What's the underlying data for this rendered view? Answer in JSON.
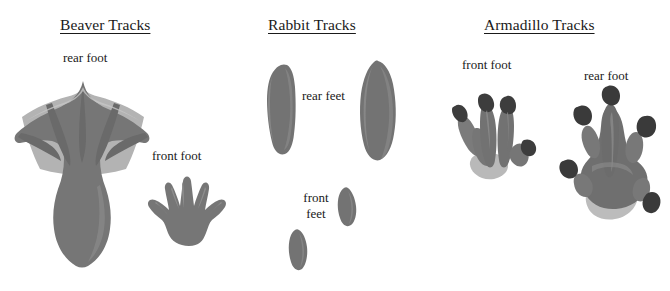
{
  "figure": {
    "title_note": "Animal track identification chart",
    "background_color": "#ffffff",
    "width": 670,
    "height": 291
  },
  "palette": {
    "toe_gray": "#7e7e7e",
    "pad_gray": "#6f6f6f",
    "web_light_gray": "#b3b3b3",
    "heel_light_gray": "#b9b9b9",
    "claw_dark": "#3b3b3b",
    "outline_gray": "#8c8c8c",
    "text_color": "#1a1a1a"
  },
  "panels": [
    {
      "id": "beaver",
      "title": "Beaver Tracks",
      "labels": [
        {
          "id": "beaver-rear",
          "text": "rear foot",
          "lines": [
            "rear foot"
          ]
        },
        {
          "id": "beaver-front",
          "text": "front foot",
          "lines": [
            "front foot"
          ]
        }
      ],
      "tracks": [
        {
          "id": "beaver-rear-foot",
          "name": "beaver-rear-foot-track",
          "description": "large webbed hind foot with five toes and light webbing",
          "toe_count": 5,
          "webbed": true
        },
        {
          "id": "beaver-front-foot",
          "name": "beaver-front-foot-track",
          "description": "small hand-like front foot with five splayed toes",
          "toe_count": 5,
          "webbed": false
        }
      ]
    },
    {
      "id": "rabbit",
      "title": "Rabbit Tracks",
      "labels": [
        {
          "id": "rabbit-rear",
          "text": "rear feet",
          "lines": [
            "rear feet"
          ]
        },
        {
          "id": "rabbit-front",
          "text": "front feet",
          "lines": [
            "front",
            "feet"
          ]
        }
      ],
      "tracks": [
        {
          "id": "rabbit-rear-left",
          "name": "rabbit-rear-left-track",
          "description": "elongated narrow hind foot print, left",
          "toe_count": 0,
          "webbed": false
        },
        {
          "id": "rabbit-rear-right",
          "name": "rabbit-rear-right-track",
          "description": "elongated wide hind foot print, right",
          "toe_count": 0,
          "webbed": false
        },
        {
          "id": "rabbit-front-upper",
          "name": "rabbit-front-upper-track",
          "description": "small oval front foot print, upper right",
          "toe_count": 0,
          "webbed": false
        },
        {
          "id": "rabbit-front-lower",
          "name": "rabbit-front-lower-track",
          "description": "small oval front foot print, lower left",
          "toe_count": 0,
          "webbed": false
        }
      ]
    },
    {
      "id": "armadillo",
      "title": "Armadillo Tracks",
      "labels": [
        {
          "id": "armadillo-front",
          "text": "front foot",
          "lines": [
            "front foot"
          ]
        },
        {
          "id": "armadillo-rear",
          "text": "rear foot",
          "lines": [
            "rear foot"
          ]
        }
      ],
      "tracks": [
        {
          "id": "armadillo-front-foot",
          "name": "armadillo-front-foot-track",
          "description": "clawed front foot with two long central toes and side toes",
          "toe_count": 4,
          "webbed": false
        },
        {
          "id": "armadillo-rear-foot",
          "name": "armadillo-rear-foot-track",
          "description": "clawed rear foot with five toes and light heel pad",
          "toe_count": 5,
          "webbed": false
        }
      ]
    }
  ]
}
